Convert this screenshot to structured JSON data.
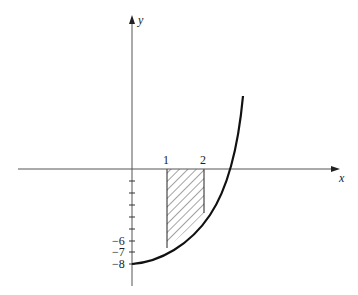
{
  "figure": {
    "axis_labels": {
      "x": "x",
      "y": "y"
    },
    "x_ticks": [
      {
        "value": 1,
        "label": "1"
      },
      {
        "value": 2,
        "label": "2"
      }
    ],
    "y_ticks": [
      {
        "value": -1,
        "label": ""
      },
      {
        "value": -2,
        "label": ""
      },
      {
        "value": -3,
        "label": ""
      },
      {
        "value": -4,
        "label": ""
      },
      {
        "value": -5,
        "label": ""
      },
      {
        "value": -6,
        "label": "−6"
      },
      {
        "value": -7,
        "label": "−7"
      },
      {
        "value": -8,
        "label": "−8"
      }
    ],
    "curve": {
      "description": "increasing concave-up curve starting at (0, -8)"
    },
    "shaded_region": {
      "from_x": 1,
      "to_x": 2,
      "description": "region between curve and x-axis, hatched"
    },
    "colors": {
      "axis": "#555555",
      "curve": "#111111",
      "hatch": "#333333"
    }
  }
}
